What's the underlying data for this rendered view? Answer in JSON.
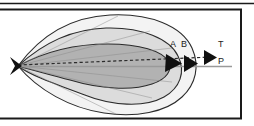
{
  "figure": {
    "name": "nested-lobe-vector-diagram",
    "background": "#ffffff",
    "frame": {
      "stroke": "#1a1a1a",
      "top_rule_y": 3,
      "box": {
        "x": -6,
        "y": 9,
        "width": 247,
        "height": 110
      }
    },
    "labels": {
      "a": "A",
      "b": "B",
      "t": "T",
      "p": "P"
    },
    "colors": {
      "outer_lobe_fill": "#f2f2f2",
      "middle_lobe_fill": "#dcdcdc",
      "inner_lobe_fill": "#b0b0b0",
      "lobe_stroke": "#2b2b2b",
      "axis_line": "#9a9a9a",
      "dashed_vector": "#2b2b2b",
      "arrow_fill": "#111111",
      "label_text": "#1a1a1a"
    },
    "geometry": {
      "origin_vertex": {
        "x": 18,
        "y": 66
      },
      "arrow_a_tip": {
        "x": 180,
        "y": 63
      },
      "arrow_b_tip": {
        "x": 196,
        "y": 63
      },
      "arrow_t_tip": {
        "x": 216,
        "y": 57
      },
      "axis_p_end": {
        "x": 232,
        "y": 66
      }
    },
    "elements": {
      "origin_marker": "left-pointing-wedge-marker",
      "outer_lobe": "outermost-teardrop-contour",
      "middle_lobe": "middle-teardrop-contour",
      "inner_lobe": "inner-shaded-teardrop-contour",
      "dashed_vector": "dashed-resultant-vector",
      "axis_line": "horizontal-reference-axis"
    }
  }
}
